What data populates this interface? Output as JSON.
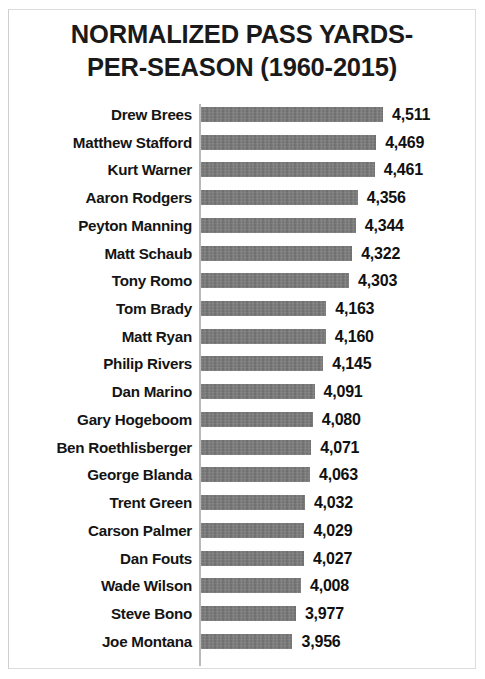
{
  "chart_data": {
    "type": "bar",
    "orientation": "horizontal",
    "title_lines": [
      "NORMALIZED PASS YARDS-",
      "PER-SEASON (1960-2015)"
    ],
    "xlabel": "",
    "ylabel": "",
    "grid": false,
    "legend": false,
    "axis_origin": 3395,
    "xlim": [
      3395,
      4560
    ],
    "bar_color": "#6f6f6f",
    "categories": [
      "Drew Brees",
      "Matthew Stafford",
      "Kurt Warner",
      "Aaron Rodgers",
      "Peyton Manning",
      "Matt Schaub",
      "Tony Romo",
      "Tom Brady",
      "Matt Ryan",
      "Philip Rivers",
      "Dan Marino",
      "Gary Hogeboom",
      "Ben Roethlisberger",
      "George Blanda",
      "Trent Green",
      "Carson Palmer",
      "Dan Fouts",
      "Wade Wilson",
      "Steve Bono",
      "Joe Montana"
    ],
    "values": [
      4511,
      4469,
      4461,
      4356,
      4344,
      4322,
      4303,
      4163,
      4160,
      4145,
      4091,
      4080,
      4071,
      4063,
      4032,
      4029,
      4027,
      4008,
      3977,
      3956
    ],
    "value_labels": [
      "4,511",
      "4,469",
      "4,461",
      "4,356",
      "4,344",
      "4,322",
      "4,303",
      "4,163",
      "4,160",
      "4,145",
      "4,091",
      "4,080",
      "4,071",
      "4,063",
      "4,032",
      "4,029",
      "4,027",
      "4,008",
      "3,977",
      "3,956"
    ]
  }
}
